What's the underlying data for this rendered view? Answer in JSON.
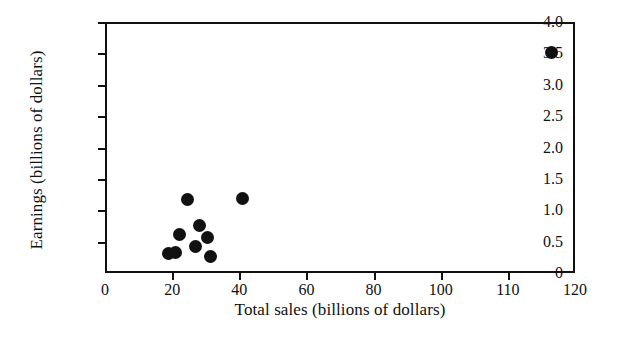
{
  "chart_data": {
    "type": "scatter",
    "title": "",
    "xlabel": "Total sales (billions of dollars)",
    "ylabel": "Earnings (billions of dollars)",
    "xlim": [
      0,
      120
    ],
    "ylim": [
      0,
      4.0
    ],
    "grid": false,
    "legend": null,
    "marker": {
      "shape": "circle",
      "color": "#111111",
      "size_px": 13
    },
    "xticks": [
      {
        "value": 0,
        "label": "0"
      },
      {
        "value": 20,
        "label": "20"
      },
      {
        "value": 40,
        "label": "40"
      },
      {
        "value": 60,
        "label": "60"
      },
      {
        "value": 80,
        "label": "80"
      },
      {
        "value": 100,
        "label": "100"
      },
      {
        "value": 110,
        "label": "110"
      },
      {
        "value": 120,
        "label": "120"
      }
    ],
    "yticks": [
      {
        "value": 0,
        "label": "0"
      },
      {
        "value": 0.5,
        "label": "0.5"
      },
      {
        "value": 1.0,
        "label": "1.0"
      },
      {
        "value": 1.5,
        "label": "1.5"
      },
      {
        "value": 2.0,
        "label": "2.0"
      },
      {
        "value": 2.5,
        "label": "2.5"
      },
      {
        "value": 3.0,
        "label": "3.0"
      },
      {
        "value": 3.5,
        "label": "3.5"
      },
      {
        "value": 4.0,
        "label": "4.0"
      }
    ],
    "points": [
      {
        "x": 18.8,
        "y": 0.31
      },
      {
        "x": 21.0,
        "y": 0.32
      },
      {
        "x": 22.2,
        "y": 0.61
      },
      {
        "x": 24.5,
        "y": 1.17
      },
      {
        "x": 27.0,
        "y": 0.42
      },
      {
        "x": 28.0,
        "y": 0.76
      },
      {
        "x": 30.5,
        "y": 0.56
      },
      {
        "x": 31.5,
        "y": 0.27
      },
      {
        "x": 41.0,
        "y": 1.19
      },
      {
        "x": 116.5,
        "y": 3.52
      }
    ]
  }
}
